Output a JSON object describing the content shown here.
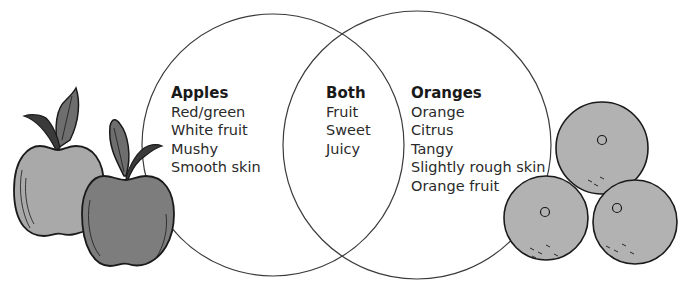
{
  "diagram": {
    "type": "venn",
    "sets": [
      {
        "id": "apples",
        "title": "Apples",
        "items": [
          "Red/green",
          "White fruit",
          "Mushy",
          "Smooth skin"
        ]
      },
      {
        "id": "both",
        "title": "Both",
        "items": [
          "Fruit",
          "Sweet",
          "Juicy"
        ]
      },
      {
        "id": "oranges",
        "title": "Oranges",
        "items": [
          "Orange",
          "Citrus",
          "Tangy",
          "Slightly rough skin",
          "Orange fruit"
        ]
      }
    ],
    "illustrations": {
      "left": "two-apples-illustration",
      "right": "three-oranges-illustration"
    },
    "colors": {
      "outline": "#3a3a3a",
      "apple_light": "#a9a9a9",
      "apple_dark": "#7d7d7d",
      "leaf": "#6e6e6e",
      "orange": "#b2b2b2"
    }
  }
}
